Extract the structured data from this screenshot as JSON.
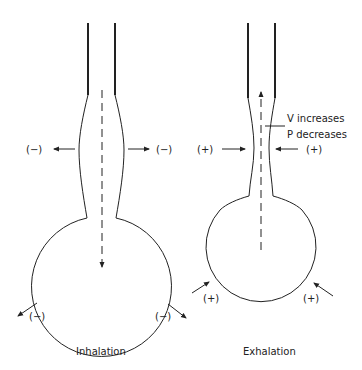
{
  "diagram": {
    "colors": {
      "stroke": "#222222",
      "background": "#ffffff"
    },
    "inhalation": {
      "caption": "Inhalation",
      "side_left_label": "(−)",
      "side_right_label": "(−)",
      "bottom_left_label": "(−)",
      "bottom_right_label": "(−)",
      "flow_direction": "down",
      "pressure_arrows": "outward"
    },
    "exhalation": {
      "caption": "Exhalation",
      "side_left_label": "(+)",
      "side_right_label": "(+)",
      "bottom_left_label": "(+)",
      "bottom_right_label": "(+)",
      "flow_direction": "up",
      "pressure_arrows": "inward",
      "annotation_line1": "V increases",
      "annotation_line2": "P decreases"
    }
  }
}
